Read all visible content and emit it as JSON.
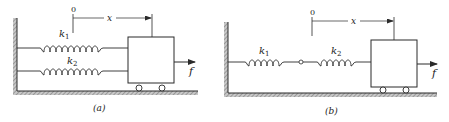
{
  "figure": {
    "panel_a": {
      "caption": "(a)",
      "origin_label": "0",
      "displacement_label": "x",
      "force_label": "f",
      "springs": [
        {
          "label": "k",
          "subscript": "1"
        },
        {
          "label": "k",
          "subscript": "2"
        }
      ],
      "arrangement": "parallel"
    },
    "panel_b": {
      "caption": "(b)",
      "origin_label": "0",
      "displacement_label": "x",
      "force_label": "f",
      "springs": [
        {
          "label": "k",
          "subscript": "1"
        },
        {
          "label": "k",
          "subscript": "2"
        }
      ],
      "arrangement": "series"
    },
    "colors": {
      "ink": "#2a2a2a",
      "hatch": "#8a8a8a",
      "background": "#ffffff"
    }
  }
}
